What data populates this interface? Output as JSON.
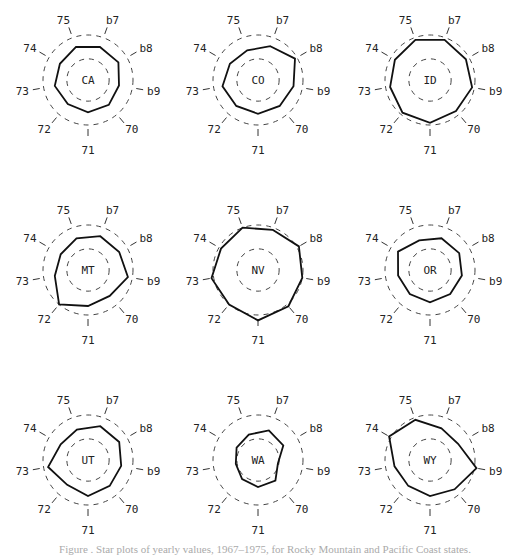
{
  "chart_data": {
    "type": "star",
    "title": "",
    "axes": [
      "67",
      "68",
      "69",
      "70",
      "71",
      "72",
      "73",
      "74",
      "75"
    ],
    "axis_display_labels": [
      "b7",
      "b8",
      "b9",
      "70",
      "71",
      "72",
      "73",
      "74",
      "75"
    ],
    "reference_rings": [
      0.47,
      1.0
    ],
    "panels": [
      {
        "state": "CA",
        "values": [
          0.78,
          0.78,
          0.7,
          0.72,
          0.72,
          0.7,
          0.75,
          0.72,
          0.78
        ]
      },
      {
        "state": "CO",
        "values": [
          0.8,
          0.95,
          0.8,
          0.75,
          0.75,
          0.75,
          0.8,
          0.72,
          0.7
        ]
      },
      {
        "state": "ID",
        "values": [
          0.95,
          0.92,
          0.95,
          0.9,
          0.95,
          0.95,
          0.9,
          0.9,
          0.95
        ]
      },
      {
        "state": "MT",
        "values": [
          0.8,
          0.8,
          0.9,
          0.75,
          0.8,
          1.0,
          0.75,
          0.7,
          0.75
        ]
      },
      {
        "state": "NV",
        "values": [
          0.95,
          1.05,
          1.0,
          1.05,
          1.12,
          1.0,
          1.05,
          0.95,
          1.0
        ]
      },
      {
        "state": "OR",
        "values": [
          0.75,
          0.75,
          0.72,
          0.7,
          0.72,
          0.7,
          0.72,
          0.82,
          0.7
        ]
      },
      {
        "state": "UT",
        "values": [
          0.8,
          0.8,
          0.75,
          0.75,
          0.8,
          0.72,
          0.9,
          0.7,
          0.72
        ]
      },
      {
        "state": "WA",
        "values": [
          0.7,
          0.65,
          0.45,
          0.6,
          0.6,
          0.55,
          0.5,
          0.55,
          0.6
        ]
      },
      {
        "state": "WY",
        "values": [
          0.75,
          0.72,
          1.05,
          0.85,
          0.8,
          0.75,
          0.8,
          1.05,
          0.95
        ]
      }
    ],
    "layout": "3x3 grid"
  },
  "caption": "Figure . Star plots of yearly values, 1967–1975, for Rocky Mountain and Pacific Coast states."
}
